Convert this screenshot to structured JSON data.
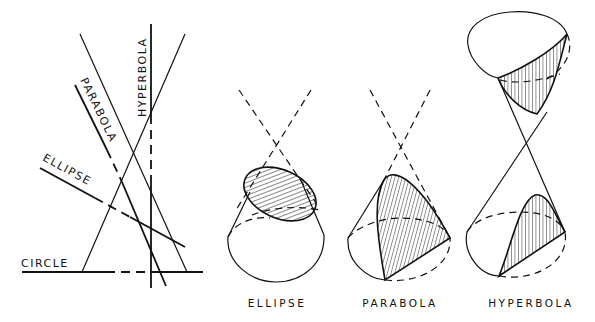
{
  "left_panel": {
    "line_labels": {
      "circle": "CIRCLE",
      "ellipse": "ELLIPSE",
      "parabola": "PARABOLA",
      "hyperbola": "HYPERBOLA"
    }
  },
  "cones": [
    {
      "id": "ellipse",
      "caption": "ELLIPSE"
    },
    {
      "id": "parabola",
      "caption": "PARABOLA"
    },
    {
      "id": "hyperbola",
      "caption": "HYPERBOLA"
    }
  ],
  "colors": {
    "ink": "#111111",
    "background": "#ffffff"
  }
}
